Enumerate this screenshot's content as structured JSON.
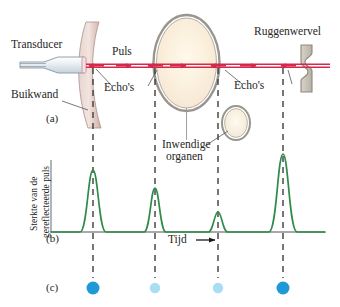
{
  "figure": {
    "language": "nl"
  },
  "panel_a": {
    "label": "(a)",
    "labels": {
      "transducer": "Transducer",
      "abdominal_wall": "Buikwand",
      "pulse": "Puls",
      "echoes_left": "Echo's",
      "echoes_right": "Echo's",
      "vertebra": "Ruggenwervel",
      "internal_organs_line1": "Inwendige",
      "internal_organs_line2": "organen"
    },
    "colors": {
      "beam": "#d4284c",
      "tissue": "#d8bcb6",
      "organ_fill": "#fbf3e4",
      "outline": "#8c8c8c",
      "bone": "#c9c2b8",
      "dashed": "#3d3d3d"
    },
    "interfaces": [
      {
        "name": "abdominal-wall",
        "x": 93
      },
      {
        "name": "organ-front",
        "x": 155
      },
      {
        "name": "organ-back",
        "x": 218
      },
      {
        "name": "vertebra",
        "x": 283
      }
    ]
  },
  "panel_b": {
    "label": "(b)",
    "ylabel_line1": "Sterkte van de",
    "ylabel_line2": "gereflecteerde puls",
    "xlabel": "Tijd",
    "xarrow": "⟶",
    "trace_color": "#2e8b48",
    "axis_color": "#8c8c8c"
  },
  "panel_c": {
    "label": "(c)",
    "dots": [
      {
        "name": "echo-dot-strong-1",
        "x": 93,
        "color": "#1f9ad6",
        "radius": 6.5
      },
      {
        "name": "echo-dot-weak-1",
        "x": 155,
        "color": "#a9ddf3",
        "radius": 5.2
      },
      {
        "name": "echo-dot-weak-2",
        "x": 218,
        "color": "#a9ddf3",
        "radius": 5.2
      },
      {
        "name": "echo-dot-strong-2",
        "x": 283,
        "color": "#1f9ad6",
        "radius": 6.5
      }
    ]
  },
  "chart_data": {
    "type": "line",
    "xlabel": "Tijd",
    "ylabel": "Sterkte van de gereflecteerde puls",
    "xlim": [
      40,
      320
    ],
    "ylim": [
      0,
      100
    ],
    "grid": false,
    "legend": null,
    "peaks": [
      {
        "label": "Buikwand",
        "x": 93,
        "height": 62,
        "width": 13
      },
      {
        "label": "Voorkant inwendig orgaan",
        "x": 155,
        "height": 44,
        "width": 11
      },
      {
        "label": "Achterkant inwendig orgaan",
        "x": 218,
        "height": 20,
        "width": 10
      },
      {
        "label": "Ruggenwervel",
        "x": 283,
        "height": 78,
        "width": 14
      }
    ],
    "baseline_y": 0
  }
}
